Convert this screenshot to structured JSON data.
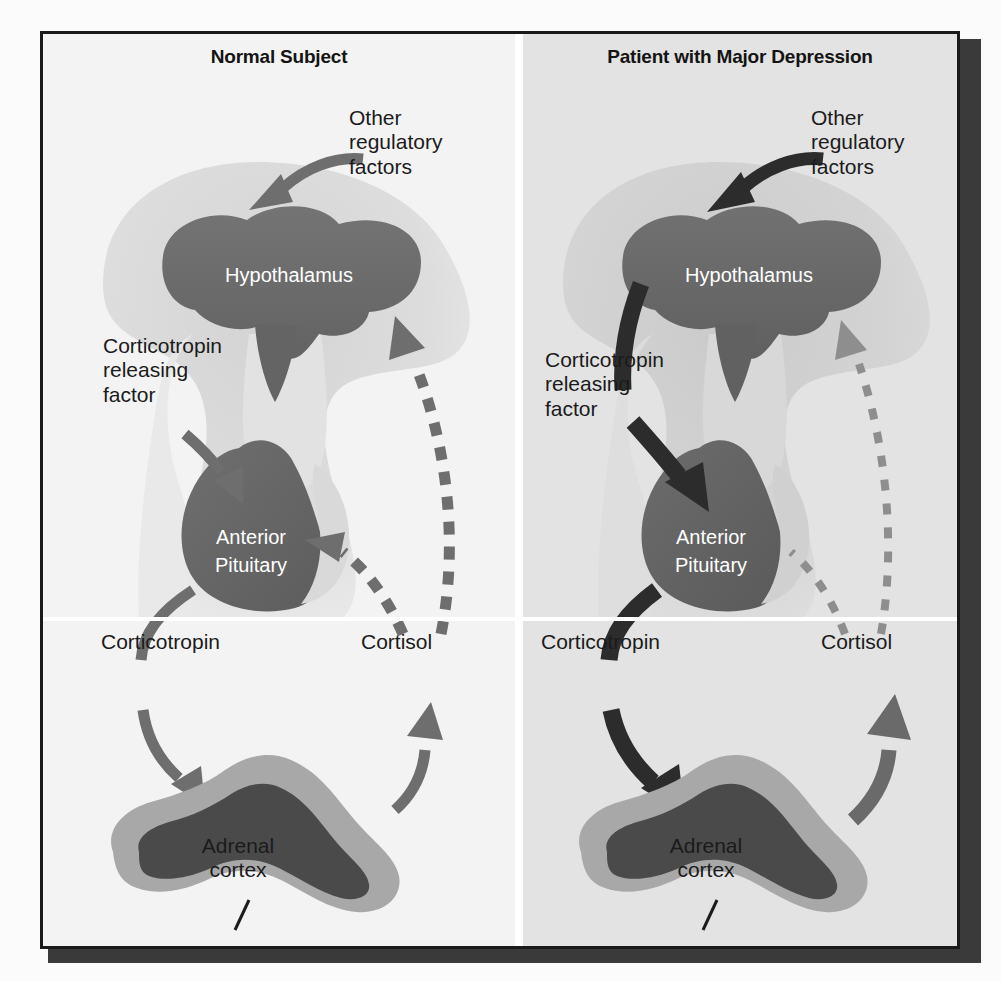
{
  "figure": {
    "type": "medical-diagram",
    "panels": [
      {
        "id": "normal",
        "title": "Normal Subject",
        "background_color": "#f3f3f3",
        "arrow_weight": "normal",
        "labels": {
          "other_regulatory_factors": "Other\nregulatory\nfactors",
          "corticotropin_releasing_factor": "Corticotropin\nreleasing\nfactor",
          "corticotropin": "Corticotropin",
          "cortisol": "Cortisol",
          "adrenal_cortex": "Adrenal\ncortex"
        },
        "organs": {
          "hypothalamus": "Hypothalamus",
          "anterior_pituitary": "Anterior\nPituitary"
        }
      },
      {
        "id": "depressed",
        "title": "Patient with Major Depression",
        "background_color": "#e3e3e3",
        "arrow_weight": "heavy",
        "labels": {
          "other_regulatory_factors": "Other\nregulatory\nfactors",
          "corticotropin_releasing_factor": "Corticotropin\nreleasing\nfactor",
          "corticotropin": "Corticotropin",
          "cortisol": "Cortisol",
          "adrenal_cortex": "Adrenal\ncortex"
        },
        "organs": {
          "hypothalamus": "Hypothalamus",
          "anterior_pituitary": "Anterior\nPituitary"
        }
      }
    ],
    "colors": {
      "frame_border": "#1a1a1a",
      "drop_shadow": "#3a3a3a",
      "brain_silhouette": "#dcdcdc",
      "brain_silhouette_right": "#d2d2d2",
      "organ_fill": "#6b6b6b",
      "organ_fill_dark": "#5e5e5e",
      "arrow_normal": "#6e6e6e",
      "arrow_heavy": "#2c2c2c",
      "dashed_normal": "#6e6e6e",
      "dashed_weak": "#8e8e8e",
      "adrenal_cortex_rim": "#a8a8a8",
      "adrenal_medulla": "#4a4a4a",
      "organ_label_text": "#ffffff",
      "body_text": "#1b1b1b"
    }
  }
}
